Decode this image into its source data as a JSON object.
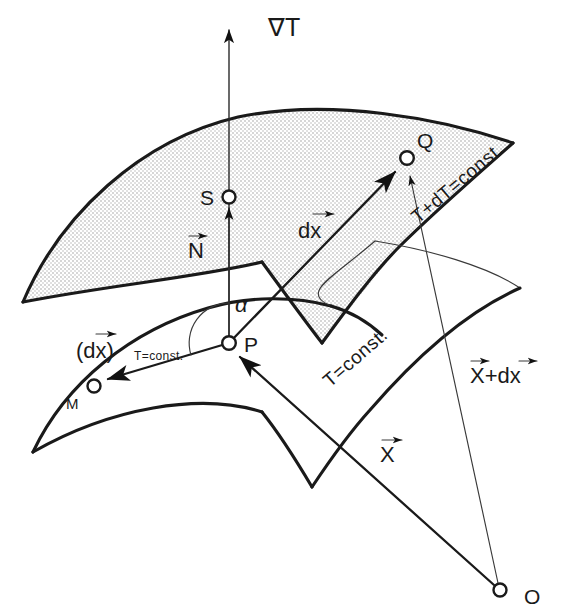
{
  "figure": {
    "background_color": "#ffffff",
    "ink_color": "#1a1a1a",
    "shade_color": "#e8e8e8"
  },
  "labels": {
    "gradient": "∇T",
    "normal_vector": "N",
    "displacement_vector": "dx",
    "tangential_displacement": "(dx)",
    "tangential_subscript": "T=const.",
    "angle": "α",
    "isotherm_lower": "T=const.",
    "isotherm_upper": "T+dT=const.",
    "position_vector": "X",
    "position_vector_plus": "X+dx"
  },
  "points": [
    {
      "id": "S",
      "label": "S",
      "cx": 229,
      "cy": 197,
      "label_x": 203,
      "label_y": 204
    },
    {
      "id": "P",
      "label": "P",
      "cx": 229,
      "cy": 343,
      "label_x": 245,
      "label_y": 350
    },
    {
      "id": "Q",
      "label": "Q",
      "cx": 407,
      "cy": 158,
      "label_x": 421,
      "label_y": 150
    },
    {
      "id": "M",
      "label": "M",
      "cx": 94,
      "cy": 386,
      "label_x": 68,
      "label_y": 406
    },
    {
      "id": "O",
      "label": "O",
      "cx": 500,
      "cy": 590,
      "label_x": 527,
      "label_y": 602
    }
  ],
  "vectors": [
    {
      "name": "gradient-arrow",
      "from": "P",
      "to": "top",
      "label": "∇T"
    },
    {
      "name": "normal-arrow",
      "from": "P",
      "to": "S",
      "label": "N"
    },
    {
      "name": "dx-arrow",
      "from": "P",
      "to": "Q",
      "label": "dx"
    },
    {
      "name": "tangential-dx-arrow",
      "from": "P",
      "to": "M",
      "label": "(dx) T=const."
    },
    {
      "name": "position-arrow",
      "from": "O",
      "to": "P",
      "label": "X"
    },
    {
      "name": "position-plus-arrow",
      "from": "O",
      "to": "Q",
      "label": "X+dx"
    }
  ],
  "surfaces": [
    {
      "name": "upper-isothermal-surface",
      "label": "T+dT=const.",
      "shaded": true
    },
    {
      "name": "lower-isothermal-surface",
      "label": "T=const.",
      "shaded": false
    }
  ]
}
